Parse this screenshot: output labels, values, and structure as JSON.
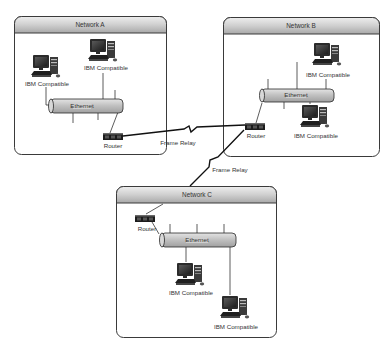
{
  "diagram": {
    "type": "network-topology",
    "networks": [
      {
        "id": "A",
        "title": "Network A",
        "lan_label": "Ethernet",
        "router_label": "Router",
        "computers": [
          {
            "label": "IBM Compatible"
          },
          {
            "label": "IBM Compatible"
          }
        ]
      },
      {
        "id": "B",
        "title": "Network B",
        "lan_label": "Ethernet",
        "router_label": "Router",
        "computers": [
          {
            "label": "IBM Compatible"
          },
          {
            "label": "IBM Compatible"
          }
        ]
      },
      {
        "id": "C",
        "title": "Network C",
        "lan_label": "Ethernet",
        "router_label": "Router",
        "computers": [
          {
            "label": "IBM Compatible"
          },
          {
            "label": "IBM Compatible"
          }
        ]
      }
    ],
    "links": [
      {
        "from": "Router A",
        "to": "Router B",
        "label": "Frame Relay"
      },
      {
        "from": "Router B",
        "to": "Router C",
        "label": "Frame Relay"
      }
    ],
    "colors": {
      "box_border": "#3a3a3a",
      "title_bar_top": "#e6e6e6",
      "title_bar_bottom": "#a9a9a9",
      "pipe_fill": "#c8c8c8",
      "pipe_border": "#2a2a2a",
      "router_fill": "#1c1c1c",
      "link_color": "#111111"
    }
  }
}
